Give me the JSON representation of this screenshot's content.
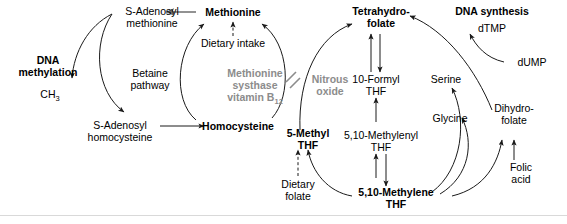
{
  "diagram": {
    "colors": {
      "text": "#000000",
      "gray_text": "#8c8c8c",
      "arrow": "#1a1a1a",
      "gray_arrow": "#8c8c8c",
      "rule": "#d9d9d9",
      "background": "#ffffff"
    },
    "nodes": [
      {
        "id": "dna-methylation",
        "label_line1": "DNA",
        "label_line2": "methylation",
        "bold": true,
        "color": "black"
      },
      {
        "id": "ch3",
        "label_main": "CH",
        "label_sub": "3",
        "bold": false,
        "color": "black"
      },
      {
        "id": "s-adenosyl-methionine",
        "label_line1": "S-Adenosyl",
        "label_line2": "methionine",
        "bold": false,
        "color": "black"
      },
      {
        "id": "s-adenosyl-homocysteine",
        "label_line1": "S-Adenosyl",
        "label_line2": "homocysteine",
        "bold": false,
        "color": "black"
      },
      {
        "id": "methionine",
        "label_line1": "Methionine",
        "bold": true,
        "color": "black"
      },
      {
        "id": "homocysteine",
        "label_line1": "Homocysteine",
        "bold": true,
        "color": "black"
      },
      {
        "id": "dietary-intake",
        "label_line1": "Dietary intake",
        "bold": false,
        "color": "black"
      },
      {
        "id": "betaine-pathway",
        "label_line1": "Betaine",
        "label_line2": "pathway",
        "bold": false,
        "color": "black"
      },
      {
        "id": "methionine-synthase",
        "label_line1": "Methionine",
        "label_line2": "systhase",
        "label_line3_main": "vitamin B",
        "label_line3_sub": "12",
        "bold": true,
        "color": "gray"
      },
      {
        "id": "nitrous-oxide",
        "label_line1": "Nitrous",
        "label_line2": "oxide",
        "bold": true,
        "color": "gray"
      },
      {
        "id": "tetrahydrofolate",
        "label_line1": "Tetrahydro-",
        "label_line2": "folate",
        "bold": true,
        "color": "black"
      },
      {
        "id": "10-formyl-thf",
        "label_line1": "10-Formyl",
        "label_line2": "THF",
        "bold": false,
        "color": "black"
      },
      {
        "id": "5-10-methylenyl-thf",
        "label_line1": "5,10-Methylenyl",
        "label_line2": "THF",
        "bold": false,
        "color": "black"
      },
      {
        "id": "5-10-methylene-thf",
        "label_line1": "5,10-Methylene",
        "label_line2": "THF",
        "bold": true,
        "color": "black"
      },
      {
        "id": "5-methyl-thf",
        "label_line1": "5-Methyl",
        "label_line2": "THF",
        "bold": true,
        "color": "black"
      },
      {
        "id": "dietary-folate",
        "label_line1": "Dietary",
        "label_line2": "folate",
        "bold": false,
        "color": "black"
      },
      {
        "id": "serine",
        "label_line1": "Serine",
        "bold": false,
        "color": "black"
      },
      {
        "id": "glycine",
        "label_line1": "Glycine",
        "bold": false,
        "color": "black"
      },
      {
        "id": "dna-synthesis",
        "label_line1": "DNA synthesis",
        "bold": true,
        "color": "black"
      },
      {
        "id": "dtmp",
        "label_line1": "dTMP",
        "bold": false,
        "color": "black"
      },
      {
        "id": "dump",
        "label_line1": "dUMP",
        "bold": false,
        "color": "black"
      },
      {
        "id": "dihydrofolate",
        "label_line1": "Dihydro-",
        "label_line2": "folate",
        "bold": false,
        "color": "black"
      },
      {
        "id": "folic-acid",
        "label_line1": "Folic",
        "label_line2": "acid",
        "bold": false,
        "color": "black"
      }
    ],
    "edges": [
      {
        "from": "methionine",
        "to": "s-adenosyl-methionine",
        "style": "solid-gray"
      },
      {
        "from": "s-adenosyl-methionine",
        "to": "ch3",
        "style": "curved"
      },
      {
        "from": "s-adenosyl-methionine",
        "to": "s-adenosyl-homocysteine",
        "style": "curved"
      },
      {
        "from": "s-adenosyl-homocysteine",
        "to": "homocysteine",
        "style": "solid"
      },
      {
        "from": "homocysteine",
        "to": "methionine",
        "style": "curved",
        "label": "betaine-pathway"
      },
      {
        "from": "homocysteine",
        "to": "methionine",
        "style": "curved",
        "label": "methionine-synthase"
      },
      {
        "from": "dietary-intake",
        "to": "methionine",
        "style": "dashed"
      },
      {
        "from": "nitrous-oxide",
        "to": "methionine-synthase",
        "style": "inhibition"
      },
      {
        "from": "5-methyl-thf",
        "to": "tetrahydrofolate",
        "style": "curved"
      },
      {
        "from": "tetrahydrofolate",
        "to": "10-formyl-thf",
        "style": "double-vertical"
      },
      {
        "from": "10-formyl-thf",
        "to": "5-10-methylenyl-thf",
        "style": "double-vertical"
      },
      {
        "from": "5-10-methylenyl-thf",
        "to": "5-10-methylene-thf",
        "style": "double-vertical"
      },
      {
        "from": "5-10-methylene-thf",
        "to": "5-methyl-thf",
        "style": "curved"
      },
      {
        "from": "dietary-folate",
        "to": "5-methyl-thf",
        "style": "dashed"
      },
      {
        "from": "5-10-methylene-thf",
        "to": "serine",
        "style": "curved"
      },
      {
        "from": "5-10-methylene-thf",
        "to": "glycine",
        "style": "curved"
      },
      {
        "from": "5-10-methylene-thf",
        "to": "dihydrofolate",
        "style": "curved"
      },
      {
        "from": "dihydrofolate",
        "to": "tetrahydrofolate",
        "style": "curved"
      },
      {
        "from": "dump",
        "to": "dtmp",
        "style": "curved"
      },
      {
        "from": "folic-acid",
        "to": "dihydrofolate",
        "style": "solid"
      }
    ]
  }
}
